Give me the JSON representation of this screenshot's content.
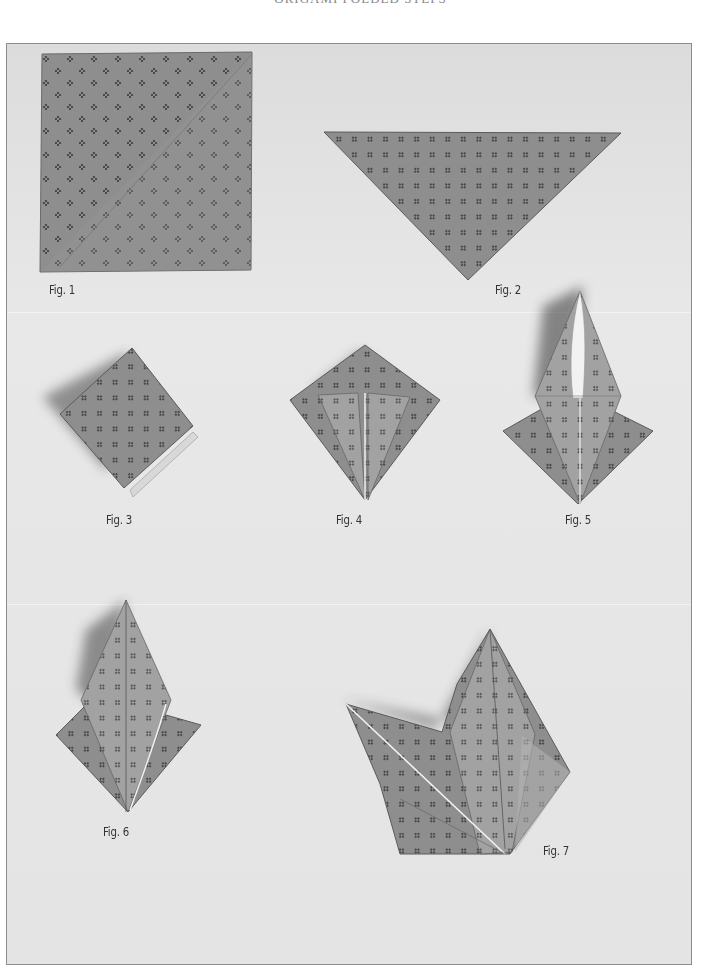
{
  "page": {
    "running_head": "ORIGAMI FOLDED STEPS",
    "paper_color": "#8f8f8f",
    "paper_light": "#b8b8b8",
    "background_color": "#e6e6e6"
  },
  "figures": [
    {
      "id": 1,
      "label": "Fig. 1",
      "shape": "square"
    },
    {
      "id": 2,
      "label": "Fig. 2",
      "shape": "triangle"
    },
    {
      "id": 3,
      "label": "Fig. 3",
      "shape": "square-base"
    },
    {
      "id": 4,
      "label": "Fig. 4",
      "shape": "kite-fold"
    },
    {
      "id": 5,
      "label": "Fig. 5",
      "shape": "petal-fold"
    },
    {
      "id": 6,
      "label": "Fig. 6",
      "shape": "bird-base"
    },
    {
      "id": 7,
      "label": "Fig. 7",
      "shape": "crane-neck-and-tail"
    }
  ]
}
